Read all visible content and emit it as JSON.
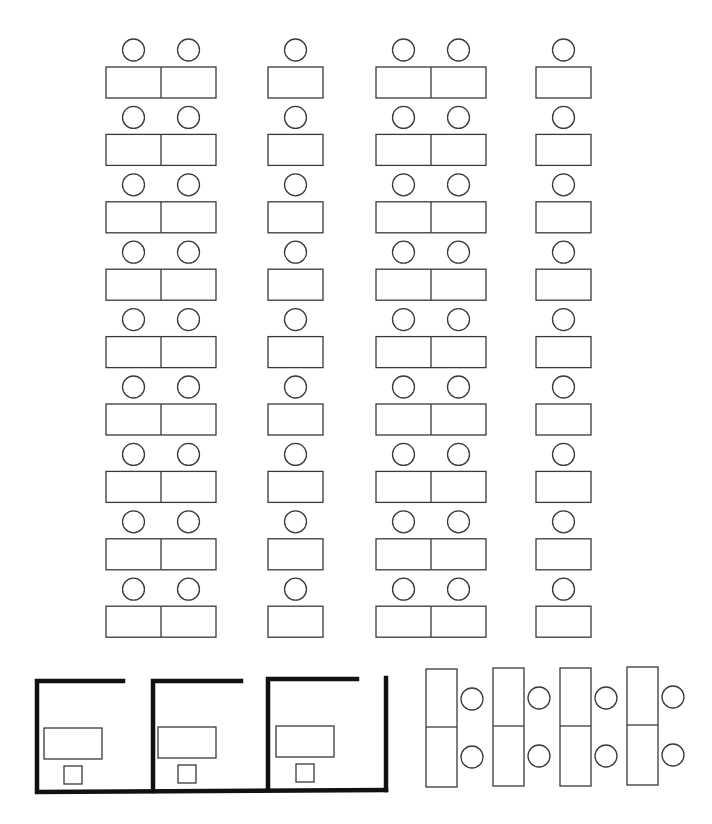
{
  "colors": {
    "line": "#3a3a3a",
    "wall": "#111111",
    "background": "#ffffff"
  },
  "open_area": {
    "row_count": 9,
    "columns": [
      {
        "id": "col-1",
        "type": "double-desk",
        "seats_per_row": 2
      },
      {
        "id": "col-2",
        "type": "single-desk",
        "seats_per_row": 1
      },
      {
        "id": "col-3",
        "type": "double-desk",
        "seats_per_row": 2
      },
      {
        "id": "col-4",
        "type": "single-desk",
        "seats_per_row": 1
      }
    ],
    "total_seats": 54
  },
  "private_offices": {
    "count": 3,
    "rooms": [
      {
        "id": "office-1",
        "desk": 1,
        "chair": 1
      },
      {
        "id": "office-2",
        "desk": 1,
        "chair": 1
      },
      {
        "id": "office-3",
        "desk": 1,
        "chair": 1
      }
    ]
  },
  "meeting_clusters": {
    "count": 4,
    "desks_per_cluster": 2,
    "chairs_per_cluster": 2
  }
}
